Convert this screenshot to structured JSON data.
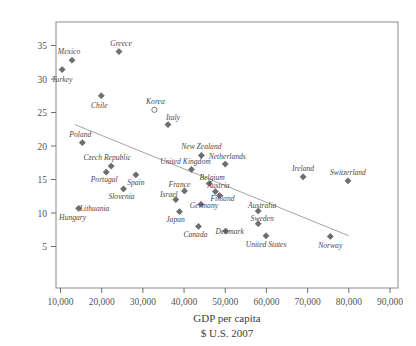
{
  "figure": {
    "cropped_header_remnant": "",
    "axis_title_line1": "GDP per capita",
    "axis_title_line2": "$ U.S. 2007"
  },
  "chart_data": {
    "type": "scatter",
    "title": "",
    "xlabel": "GDP per capita $ U.S. 2007",
    "ylabel": "",
    "xlim": [
      0,
      90000
    ],
    "ylim": [
      0,
      37
    ],
    "grid": false,
    "legend": false,
    "xticks": [
      10000,
      20000,
      30000,
      40000,
      50000,
      60000,
      70000,
      80000,
      90000
    ],
    "xticklabels": [
      "10,000",
      "20,000",
      "30,000",
      "40,000",
      "50,000",
      "60,000",
      "70,000",
      "80,000",
      "90,000"
    ],
    "yticks": [
      5,
      10,
      15,
      20,
      25,
      30,
      35
    ],
    "yticklabels": [
      "5",
      "10",
      "15",
      "20",
      "25",
      "30",
      "35"
    ],
    "trendline": {
      "x_start": 13500,
      "y_start": 23.2,
      "x_end": 80000,
      "y_end": 6.6
    },
    "points": [
      {
        "label": "Turkey",
        "x": 10400,
        "y": 31.4,
        "marker": "filled-diamond",
        "label_dx": 0,
        "label_dy": 12
      },
      {
        "label": "Mexico",
        "x": 12800,
        "y": 32.8,
        "marker": "filled-diamond",
        "label_dx": -3,
        "label_dy": -6
      },
      {
        "label": "Greece",
        "x": 24200,
        "y": 34.1,
        "marker": "filled-diamond",
        "label_dx": 2,
        "label_dy": -6
      },
      {
        "label": "Chile",
        "x": 19900,
        "y": 27.5,
        "marker": "filled-diamond",
        "label_dx": -2,
        "label_dy": 12
      },
      {
        "label": "Korea",
        "x": 32800,
        "y": 25.4,
        "marker": "open-circle",
        "label_dx": 1,
        "label_dy": -6
      },
      {
        "label": "Italy",
        "x": 36100,
        "y": 23.2,
        "marker": "filled-diamond",
        "label_dx": 5,
        "label_dy": -5
      },
      {
        "label": "Poland",
        "x": 15300,
        "y": 20.5,
        "marker": "filled-diamond",
        "label_dx": -2,
        "label_dy": -6
      },
      {
        "label": "Czech Republic",
        "x": 22300,
        "y": 17.0,
        "marker": "filled-diamond",
        "label_dx": -4,
        "label_dy": -6
      },
      {
        "label": "New Zealand",
        "x": 44200,
        "y": 18.6,
        "marker": "filled-diamond",
        "label_dx": 0,
        "label_dy": -6
      },
      {
        "label": "Netherlands",
        "x": 50000,
        "y": 17.3,
        "marker": "filled-diamond",
        "label_dx": 2,
        "label_dy": -5
      },
      {
        "label": "United Kingdom",
        "x": 41800,
        "y": 16.5,
        "marker": "filled-diamond",
        "label_dx": -6,
        "label_dy": -5
      },
      {
        "label": "Portugal",
        "x": 21100,
        "y": 16.1,
        "marker": "filled-diamond",
        "label_dx": -2,
        "label_dy": 10
      },
      {
        "label": "Spain",
        "x": 28300,
        "y": 15.7,
        "marker": "filled-diamond",
        "label_dx": 0,
        "label_dy": 10
      },
      {
        "label": "Ireland",
        "x": 68900,
        "y": 15.4,
        "marker": "filled-diamond",
        "label_dx": 0,
        "label_dy": -6
      },
      {
        "label": "Switzerland",
        "x": 79800,
        "y": 14.8,
        "marker": "filled-diamond",
        "label_dx": 0,
        "label_dy": -6
      },
      {
        "label": "Belgium",
        "x": 46100,
        "y": 14.4,
        "marker": "filled-diamond",
        "label_dx": 3,
        "label_dy": -4
      },
      {
        "label": "Austria",
        "x": 47600,
        "y": 13.2,
        "marker": "filled-diamond",
        "label_dx": 3,
        "label_dy": -4
      },
      {
        "label": "Finland",
        "x": 48600,
        "y": 12.6,
        "marker": "filled-diamond",
        "label_dx": 3,
        "label_dy": 5
      },
      {
        "label": "France",
        "x": 40100,
        "y": 13.3,
        "marker": "filled-diamond",
        "label_dx": -5,
        "label_dy": -4
      },
      {
        "label": "Slovenia",
        "x": 25300,
        "y": 13.6,
        "marker": "filled-diamond",
        "label_dx": -2,
        "label_dy": 10
      },
      {
        "label": "Israel",
        "x": 38000,
        "y": 12.0,
        "marker": "filled-diamond",
        "label_dx": -7,
        "label_dy": -3
      },
      {
        "label": "Germany",
        "x": 44100,
        "y": 11.3,
        "marker": "filled-diamond",
        "label_dx": 3,
        "label_dy": 4
      },
      {
        "label": "Australia",
        "x": 58000,
        "y": 10.3,
        "marker": "filled-diamond",
        "label_dx": 4,
        "label_dy": -3
      },
      {
        "label": "Japan",
        "x": 38900,
        "y": 10.2,
        "marker": "filled-diamond",
        "label_dx": -4,
        "label_dy": 10
      },
      {
        "label": "Sweden",
        "x": 58000,
        "y": 8.4,
        "marker": "filled-diamond",
        "label_dx": 4,
        "label_dy": -3
      },
      {
        "label": "Canada",
        "x": 43500,
        "y": 8.0,
        "marker": "filled-diamond",
        "label_dx": -3,
        "label_dy": 11
      },
      {
        "label": "Denmark",
        "x": 50100,
        "y": 7.3,
        "marker": "filled-diamond",
        "label_dx": 4,
        "label_dy": 3
      },
      {
        "label": "United States",
        "x": 59900,
        "y": 6.6,
        "marker": "filled-diamond",
        "label_dx": 0,
        "label_dy": 11
      },
      {
        "label": "Norway",
        "x": 75500,
        "y": 6.5,
        "marker": "filled-diamond",
        "label_dx": 0,
        "label_dy": 12
      },
      {
        "label": "Hungary",
        "x": 14400,
        "y": 10.7,
        "marker": "filled-diamond",
        "label_dx": -6,
        "label_dy": 12
      },
      {
        "label": "Lithuania",
        "x": 14400,
        "y": 10.7,
        "marker": "none",
        "label_dx": 16,
        "label_dy": 3
      }
    ]
  }
}
